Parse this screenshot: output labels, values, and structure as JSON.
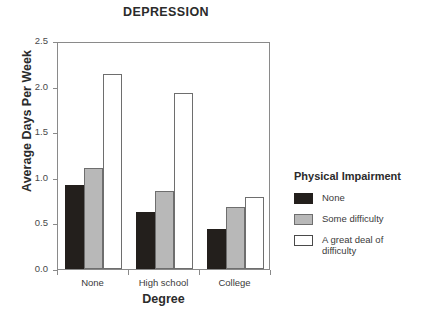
{
  "chart_data": {
    "type": "bar",
    "title": "DEPRESSION",
    "xlabel": "Degree",
    "ylabel": "Average Days Per Week",
    "categories": [
      "None",
      "High school",
      "College"
    ],
    "series": [
      {
        "name": "None",
        "color": "#231f1c",
        "values": [
          0.92,
          0.62,
          0.44
        ]
      },
      {
        "name": "Some difficulty",
        "color": "#b8b8b8",
        "values": [
          1.11,
          0.86,
          0.68
        ]
      },
      {
        "name": "A great deal of difficulty",
        "color": "#ffffff",
        "values": [
          2.14,
          1.93,
          0.79
        ]
      }
    ],
    "ylim": [
      0.0,
      2.5
    ],
    "ytick_labels": [
      "0.0",
      "0.5",
      "1.0",
      "1.5",
      "2.0",
      "2.5"
    ],
    "ytick_values": [
      0.0,
      0.5,
      1.0,
      1.5,
      2.0,
      2.5
    ],
    "grid": false,
    "legend": {
      "title": "Physical Impairment",
      "position": "right",
      "entries": [
        "None",
        "Some difficulty",
        "A great deal of difficulty"
      ]
    }
  }
}
